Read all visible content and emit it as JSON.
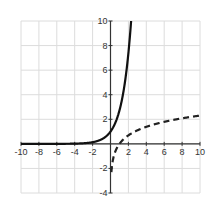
{
  "chart_data": {
    "type": "line",
    "title": "",
    "xlabel": "",
    "ylabel": "",
    "xlim": [
      -10,
      10
    ],
    "ylim": [
      -4,
      10
    ],
    "grid": true,
    "legend": null,
    "x_ticks": [
      -10,
      -8,
      -6,
      -4,
      -2,
      2,
      4,
      6,
      8,
      10
    ],
    "y_ticks": [
      -4,
      -2,
      2,
      4,
      6,
      8,
      10
    ],
    "x_tick_labels": [
      "-10",
      "-8",
      "-6",
      "-4",
      "-2",
      "2",
      "4",
      "6",
      "8",
      "10"
    ],
    "y_tick_labels": [
      "-4",
      "-2",
      "2",
      "4",
      "6",
      "8",
      "10"
    ],
    "series": [
      {
        "name": "y = e^x",
        "style": "solid",
        "color": "#111111",
        "function": "exp",
        "x": [
          -10,
          -8,
          -6,
          -4,
          -2,
          -1,
          0,
          1,
          1.5,
          2,
          2.3
        ],
        "y": [
          5e-05,
          0.0003,
          0.0025,
          0.018,
          0.135,
          0.368,
          1,
          2.718,
          4.48,
          7.39,
          9.97
        ]
      },
      {
        "name": "y = ln(x)",
        "style": "dashed",
        "color": "#222222",
        "function": "ln",
        "x": [
          0.1,
          0.5,
          1,
          2,
          4,
          6,
          8,
          10
        ],
        "y": [
          -2.3,
          -0.69,
          0,
          0.69,
          1.39,
          1.79,
          2.08,
          2.3
        ]
      }
    ]
  }
}
